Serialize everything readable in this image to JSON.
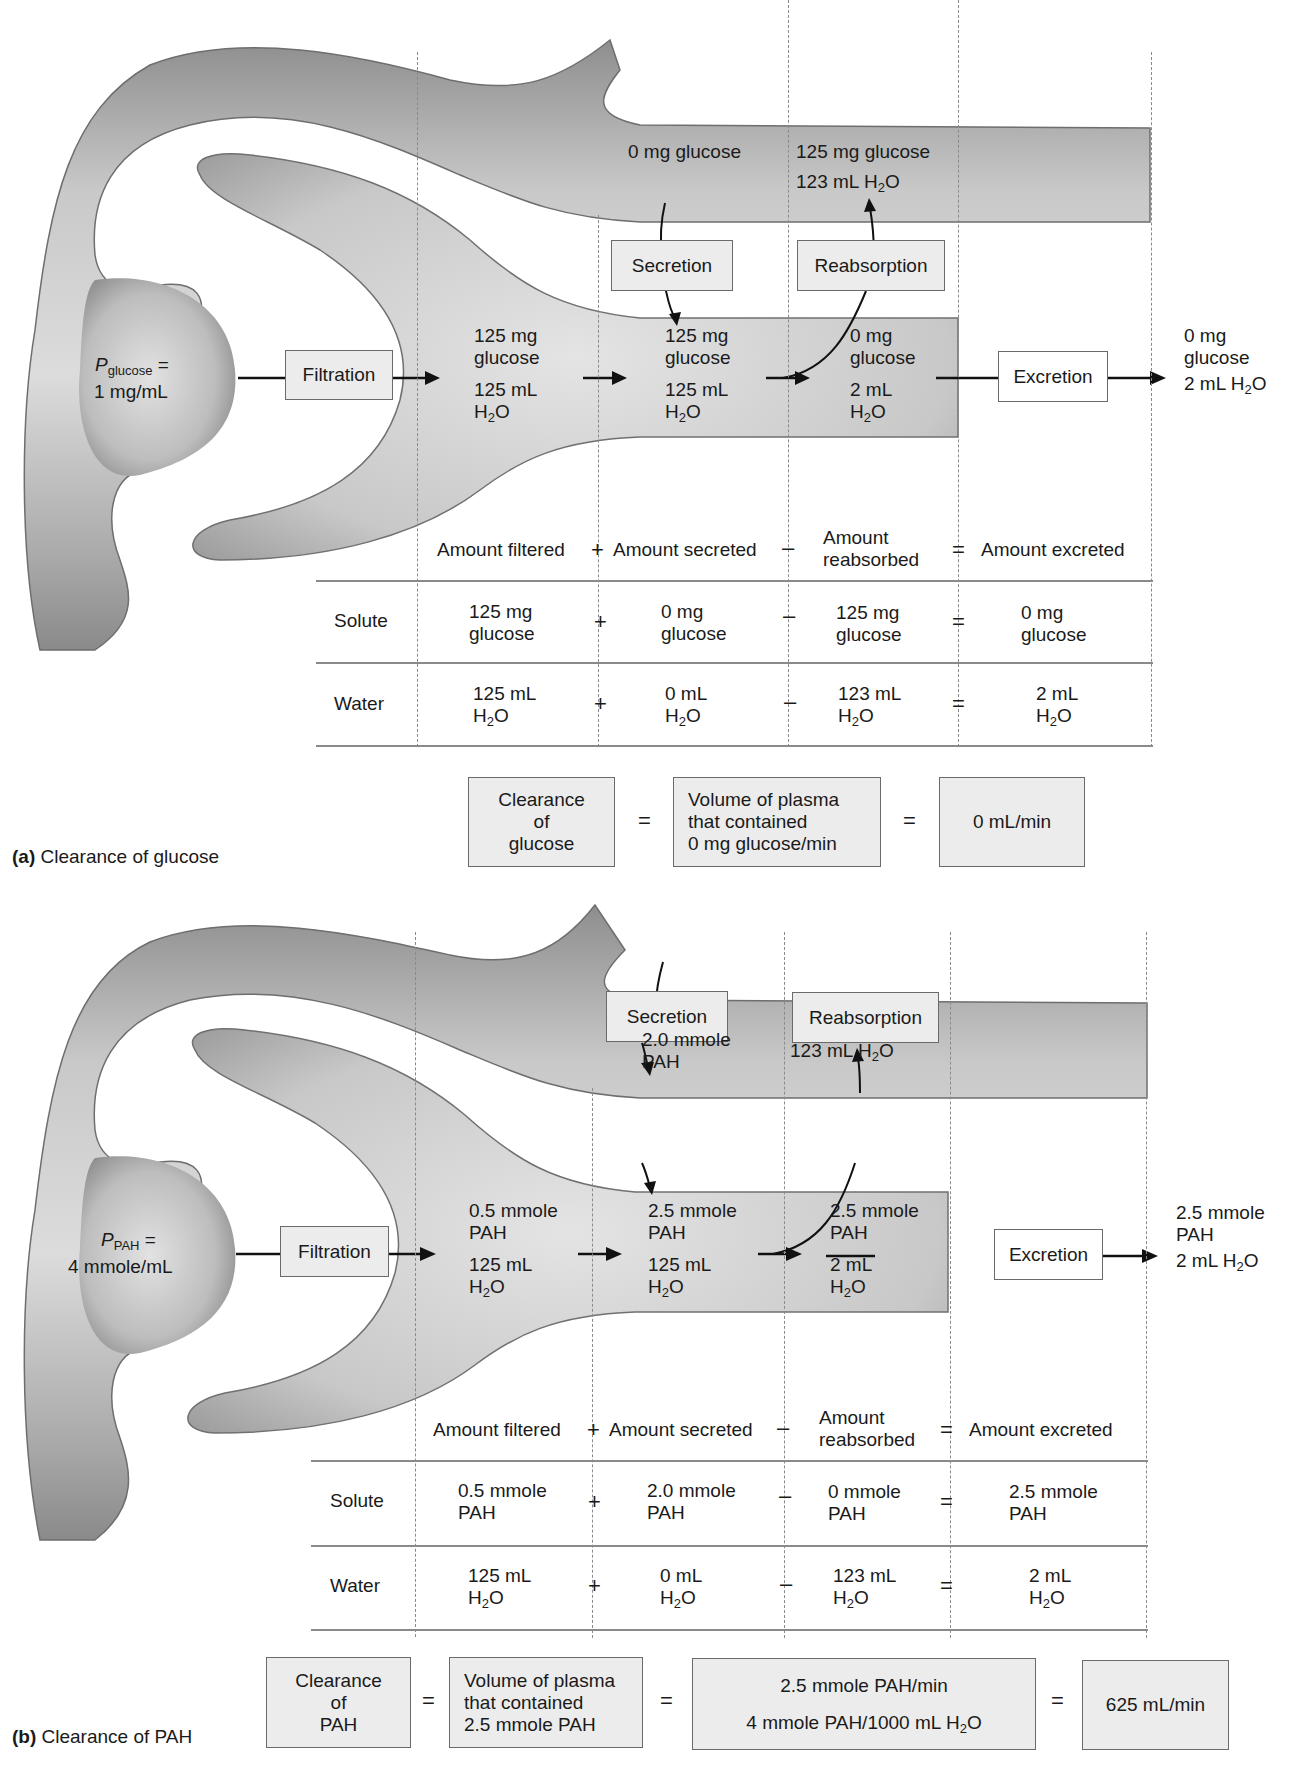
{
  "panel_a": {
    "caption_letter": "(a)",
    "caption_text": "Clearance of glucose",
    "plasma_label_var": "P",
    "plasma_label_sub": "glucose",
    "plasma_label_eq": "=",
    "plasma_value": "1 mg/mL",
    "process_boxes": {
      "filtration": "Filtration",
      "secretion": "Secretion",
      "reabsorption": "Reabsorption",
      "excretion": "Excretion"
    },
    "capillary": {
      "secretion_source": "0 mg glucose",
      "reabsorbed_solute": "125 mg glucose",
      "reabsorbed_water": "123 mL H",
      "reabsorbed_water_sub": "2",
      "reabsorbed_water_end": "O"
    },
    "tubule": {
      "filtered_solute_1": "125 mg",
      "filtered_solute_2": "glucose",
      "filtered_water_1": "125 mL",
      "after_secretion_solute_1": "125 mg",
      "after_secretion_solute_2": "glucose",
      "after_secretion_water_1": "125 mL",
      "after_reabsorption_solute_1": "0 mg",
      "after_reabsorption_solute_2": "glucose",
      "after_reabsorption_water_1": "2 mL"
    },
    "urine": {
      "solute_1": "0 mg",
      "solute_2": "glucose",
      "water": "2 mL H"
    },
    "table": {
      "headers": [
        "Amount filtered",
        "Amount secreted",
        "Amount",
        "reabsorbed",
        "Amount excreted"
      ],
      "operators": [
        "+",
        "–",
        "="
      ],
      "rows": [
        {
          "label": "Solute",
          "cells": [
            [
              "125 mg",
              "glucose"
            ],
            [
              "0 mg",
              "glucose"
            ],
            [
              "125 mg",
              "glucose"
            ],
            [
              "0 mg",
              "glucose"
            ]
          ]
        },
        {
          "label": "Water",
          "cells": [
            [
              "125 mL",
              "H"
            ],
            [
              "0 mL",
              "H"
            ],
            [
              "123 mL",
              "H"
            ],
            [
              "2 mL",
              "H"
            ]
          ]
        }
      ]
    },
    "equation": {
      "term1": [
        "Clearance",
        "of",
        "glucose"
      ],
      "eq": "=",
      "term2": [
        "Volume of plasma",
        "that contained",
        "0 mg glucose/min"
      ],
      "result": "0 mL/min"
    }
  },
  "panel_b": {
    "caption_letter": "(b)",
    "caption_text": "Clearance of PAH",
    "plasma_label_var": "P",
    "plasma_label_sub": "PAH",
    "plasma_label_eq": "=",
    "plasma_value": "4 mmole/mL",
    "process_boxes": {
      "filtration": "Filtration",
      "secretion": "Secretion",
      "reabsorption": "Reabsorption",
      "excretion": "Excretion"
    },
    "capillary": {
      "secretion_source_1": "2.0 mmole",
      "secretion_source_2": "PAH",
      "reabsorbed_water": "123 mL H"
    },
    "tubule": {
      "filtered_solute_1": "0.5 mmole",
      "filtered_solute_2": "PAH",
      "filtered_water_1": "125 mL",
      "after_secretion_solute_1": "2.5 mmole",
      "after_secretion_solute_2": "PAH",
      "after_secretion_water_1": "125 mL",
      "after_reabsorption_solute_1": "2.5 mmole",
      "after_reabsorption_solute_2": "PAH",
      "after_reabsorption_water_1": "2 mL"
    },
    "urine": {
      "solute_1": "2.5 mmole",
      "solute_2": "PAH",
      "water": "2 mL H"
    },
    "table": {
      "headers": [
        "Amount filtered",
        "Amount secreted",
        "Amount",
        "reabsorbed",
        "Amount excreted"
      ],
      "operators": [
        "+",
        "–",
        "="
      ],
      "rows": [
        {
          "label": "Solute",
          "cells": [
            [
              "0.5 mmole",
              "PAH"
            ],
            [
              "2.0 mmole",
              "PAH"
            ],
            [
              "0 mmole",
              "PAH"
            ],
            [
              "2.5 mmole",
              "PAH"
            ]
          ]
        },
        {
          "label": "Water",
          "cells": [
            [
              "125 mL",
              "H"
            ],
            [
              "0 mL",
              "H"
            ],
            [
              "123 mL",
              "H"
            ],
            [
              "2 mL",
              "H"
            ]
          ]
        }
      ]
    },
    "equation": {
      "term1": [
        "Clearance",
        "of",
        "PAH"
      ],
      "eq": "=",
      "term2": [
        "Volume of plasma",
        "that contained",
        "2.5 mmole PAH"
      ],
      "fraction_numerator": "2.5 mmole PAH/min",
      "fraction_denominator": "4 mmole PAH/1000 mL H",
      "result": "625 mL/min"
    }
  },
  "common": {
    "water_sub": "2",
    "water_end": "O",
    "h2o_h": "H"
  },
  "colors": {
    "tube_fill": "#c4c4c4",
    "tube_edge": "#6e6e6e",
    "box_fill": "#ececec",
    "box_border": "#6a6a6a",
    "text": "#1a1a1a"
  }
}
